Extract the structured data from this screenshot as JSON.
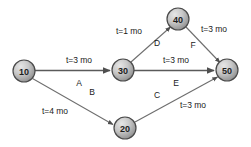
{
  "diagram": {
    "type": "activity-on-arrow network",
    "colors": {
      "node_fill_light": "#d9d9d9",
      "node_fill_dark": "#8f8f8f",
      "node_stroke": "#4a4a4a",
      "edge_stroke": "#6e6e6e",
      "text": "#1a1a1a",
      "background": "#ffffff"
    },
    "nodes": [
      {
        "id": "n10",
        "label": "10",
        "cx": 24,
        "cy": 71,
        "r": 11
      },
      {
        "id": "n20",
        "label": "20",
        "cx": 125,
        "cy": 128,
        "r": 11
      },
      {
        "id": "n30",
        "label": "30",
        "cx": 123,
        "cy": 70,
        "r": 11
      },
      {
        "id": "n40",
        "label": "40",
        "cx": 178,
        "cy": 19,
        "r": 11
      },
      {
        "id": "n50",
        "label": "50",
        "cx": 227,
        "cy": 70,
        "r": 11
      }
    ],
    "edges": [
      {
        "id": "eA",
        "from": "10",
        "to": "30",
        "activity": "A",
        "duration": "t=3 mo",
        "duration_x": 79,
        "duration_y": 60,
        "activity_x": 79,
        "activity_y": 83
      },
      {
        "id": "eB",
        "from": "10",
        "to": "20",
        "activity": "B",
        "duration": "t=4 mo",
        "duration_x": 55,
        "duration_y": 111,
        "activity_x": 92,
        "activity_y": 92
      },
      {
        "id": "eD",
        "from": "30",
        "to": "40",
        "activity": "D",
        "duration": "t=1 mo",
        "duration_x": 129,
        "duration_y": 31,
        "activity_x": 157,
        "activity_y": 43
      },
      {
        "id": "eE",
        "from": "30",
        "to": "50",
        "activity": "E",
        "duration": "t=3 mo",
        "duration_x": 176,
        "duration_y": 60,
        "activity_x": 176,
        "activity_y": 83
      },
      {
        "id": "eF",
        "from": "40",
        "to": "50",
        "activity": "F",
        "duration": "t=3 mo",
        "duration_x": 214,
        "duration_y": 29,
        "activity_x": 193,
        "activity_y": 45
      },
      {
        "id": "eC",
        "from": "20",
        "to": "50",
        "activity": "C",
        "duration": "t=3 mo",
        "duration_x": 193,
        "duration_y": 105,
        "activity_x": 157,
        "activity_y": 95
      }
    ]
  }
}
